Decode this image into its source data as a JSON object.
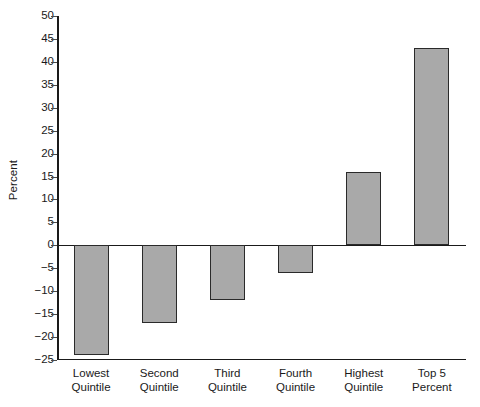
{
  "chart_data": {
    "type": "bar",
    "title": "",
    "subtitle": "",
    "xlabel": "",
    "ylabel": "Percent",
    "categories": [
      "Lowest Quintile",
      "Second Quintile",
      "Third Quintile",
      "Fourth Quintile",
      "Highest Quintile",
      "Top 5 Percent"
    ],
    "category_lines": [
      [
        "Lowest",
        "Quintile"
      ],
      [
        "Second",
        "Quintile"
      ],
      [
        "Third",
        "Quintile"
      ],
      [
        "Fourth",
        "Quintile"
      ],
      [
        "Highest",
        "Quintile"
      ],
      [
        "Top 5",
        "Percent"
      ]
    ],
    "values": [
      -24,
      -17,
      -12,
      -6,
      16,
      43
    ],
    "ylim": [
      -25,
      50
    ],
    "ytick_step": 5,
    "ytick_labels": [
      "50",
      "45",
      "40",
      "35",
      "30",
      "25",
      "20",
      "15",
      "10",
      "5",
      "0",
      "-5",
      "-10",
      "-15",
      "-20",
      "-25"
    ],
    "ytick_values": [
      50,
      45,
      40,
      35,
      30,
      25,
      20,
      15,
      10,
      5,
      0,
      -5,
      -10,
      -15,
      -20,
      -25
    ],
    "grid": false,
    "legend": false,
    "bar_fill_color": "#a9a9a9",
    "bar_border_color": "#2a2a2a",
    "axis_color": "#1a1a1a",
    "background_color": "#ffffff"
  }
}
